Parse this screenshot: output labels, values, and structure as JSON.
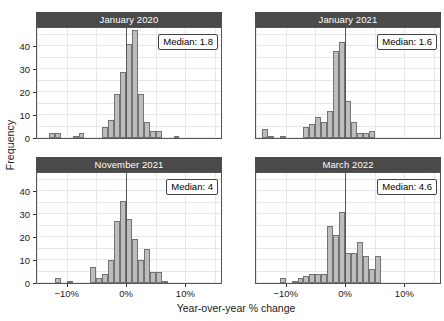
{
  "chart_data": {
    "type": "bar",
    "title": "",
    "xlabel": "Year-over-year % change",
    "ylabel": "Frequency",
    "xlim": [
      -15,
      16
    ],
    "ylim": [
      0,
      48
    ],
    "grid": true,
    "legend": false,
    "bin_width": 1,
    "xticks": [
      -10,
      0,
      10
    ],
    "xtick_labels": [
      "−10%",
      "0%",
      "10%"
    ],
    "yticks": [
      0,
      10,
      20,
      30,
      40
    ],
    "ytick_labels": [
      "0",
      "10",
      "20",
      "30",
      "40"
    ],
    "facets": [
      {
        "title": "January 2020",
        "median_label": "Median: 1.8",
        "median_value": 1.8,
        "bins": [
          -14,
          -13,
          -12,
          -11,
          -10,
          -9,
          -8,
          -7,
          -6,
          -5,
          -4,
          -3,
          -2,
          -1,
          0,
          1,
          2,
          3,
          4,
          5,
          6,
          7,
          8,
          9,
          10,
          11,
          12,
          13,
          14,
          15
        ],
        "values": [
          0,
          2,
          2,
          0,
          0,
          1,
          2,
          0,
          0,
          0,
          5,
          8,
          19,
          29,
          41,
          47,
          19,
          7,
          3,
          3,
          0,
          0,
          1,
          0,
          0,
          0,
          0,
          0,
          0,
          0
        ]
      },
      {
        "title": "January 2021",
        "median_label": "Median: 1.6",
        "median_value": 1.6,
        "bins": [
          -14,
          -13,
          -12,
          -11,
          -10,
          -9,
          -8,
          -7,
          -6,
          -5,
          -4,
          -3,
          -2,
          -1,
          0,
          1,
          2,
          3,
          4,
          5,
          6,
          7,
          8,
          9,
          10,
          11,
          12,
          13,
          14,
          15
        ],
        "values": [
          4,
          1,
          0,
          1,
          0,
          0,
          0,
          5,
          6,
          9,
          7,
          12,
          38,
          42,
          16,
          7,
          2,
          2,
          3,
          0,
          0,
          0,
          0,
          0,
          0,
          0,
          0,
          0,
          0,
          0
        ]
      },
      {
        "title": "November 2021",
        "median_label": "Median: 4",
        "median_value": 4,
        "bins": [
          -14,
          -13,
          -12,
          -11,
          -10,
          -9,
          -8,
          -7,
          -6,
          -5,
          -4,
          -3,
          -2,
          -1,
          0,
          1,
          2,
          3,
          4,
          5,
          6,
          7,
          8,
          9,
          10,
          11,
          12,
          13,
          14,
          15
        ],
        "values": [
          0,
          0,
          2,
          0,
          1,
          0,
          0,
          0,
          7,
          2,
          4,
          10,
          27,
          36,
          28,
          19,
          10,
          15,
          5,
          5,
          1,
          0,
          0,
          0,
          0,
          0,
          0,
          0,
          0,
          0
        ]
      },
      {
        "title": "March 2022",
        "median_label": "Median: 4.6",
        "median_value": 4.6,
        "bins": [
          -14,
          -13,
          -12,
          -11,
          -10,
          -9,
          -8,
          -7,
          -6,
          -5,
          -4,
          -3,
          -2,
          -1,
          0,
          1,
          2,
          3,
          4,
          5,
          6,
          7,
          8,
          9,
          10,
          11,
          12,
          13,
          14,
          15
        ],
        "values": [
          0,
          0,
          0,
          2,
          0,
          1,
          2,
          3,
          4,
          4,
          4,
          25,
          21,
          31,
          13,
          13,
          18,
          12,
          6,
          12,
          0,
          0,
          0,
          0,
          0,
          0,
          0,
          0,
          0,
          0
        ]
      }
    ],
    "colors": {
      "bar_fill": "#bdbdbd",
      "bar_edge": "#737373",
      "strip_bg": "#4a4a4a",
      "strip_text": "#ffffff",
      "grid": "#e6e6ec",
      "axis": "#555555",
      "background": "#ffffff"
    }
  }
}
